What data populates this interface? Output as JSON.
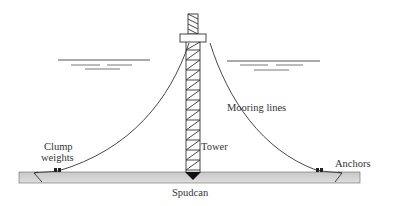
{
  "diagram": {
    "labels": {
      "mooring_lines": "Mooring lines",
      "tower": "Tower",
      "clump_weights_line1": "Clump",
      "clump_weights_line2": "weights",
      "anchors": "Anchors",
      "spudcan": "Spudcan"
    },
    "colors": {
      "line": "#333333",
      "seabed_fill": "#d4d4d4",
      "spudcan": "#111111"
    }
  }
}
